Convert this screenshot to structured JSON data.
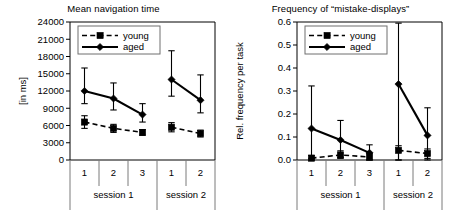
{
  "figure": {
    "panels": [
      "left",
      "right"
    ]
  },
  "chart_data": [
    {
      "panel": "left",
      "type": "line",
      "title": "Mean navigation time",
      "xlabel": "",
      "ylabel": "[in ms]",
      "ylim": [
        0,
        24000
      ],
      "yticks": [
        0,
        3000,
        6000,
        9000,
        12000,
        15000,
        18000,
        21000,
        24000
      ],
      "ytick_labels": [
        "0",
        "3000",
        "6000",
        "9000",
        "12000",
        "15000",
        "18000",
        "21000",
        "24000"
      ],
      "grid": false,
      "legend_position": "top-left",
      "categories": [
        "1",
        "2",
        "3",
        "1",
        "2"
      ],
      "groups": [
        {
          "label": "session 1",
          "categories": [
            "1",
            "2",
            "3"
          ]
        },
        {
          "label": "session 2",
          "categories": [
            "1",
            "2"
          ]
        }
      ],
      "series": [
        {
          "name": "young",
          "marker": "square",
          "line": "dashed",
          "values": [
            6600,
            5500,
            4800,
            5700,
            4600
          ],
          "err_low": [
            1100,
            700,
            500,
            800,
            600
          ],
          "err_high": [
            1100,
            700,
            500,
            800,
            600
          ]
        },
        {
          "name": "aged",
          "marker": "diamond",
          "line": "solid",
          "values": [
            12000,
            10700,
            7900,
            14000,
            10400
          ],
          "err_low": [
            2200,
            2000,
            1300,
            2900,
            2200
          ],
          "err_high": [
            4000,
            2700,
            1900,
            5000,
            4400
          ]
        }
      ]
    },
    {
      "panel": "right",
      "type": "line",
      "title": "Frequency of “mistake-displays”",
      "xlabel": "",
      "ylabel": "Rel. frequency per task",
      "ylim": [
        0.0,
        0.6
      ],
      "yticks": [
        0.0,
        0.1,
        0.2,
        0.3,
        0.4,
        0.5,
        0.6
      ],
      "ytick_labels": [
        "0.0",
        "0.1",
        "0.2",
        "0.3",
        "0.4",
        "0.5",
        "0.6"
      ],
      "grid": false,
      "legend_position": "top-left",
      "categories": [
        "1",
        "2",
        "3",
        "1",
        "2"
      ],
      "groups": [
        {
          "label": "session 1",
          "categories": [
            "1",
            "2",
            "3"
          ]
        },
        {
          "label": "session 2",
          "categories": [
            "1",
            "2"
          ]
        }
      ],
      "series": [
        {
          "name": "young",
          "marker": "square",
          "line": "dashed",
          "values": [
            0.008,
            0.022,
            0.013,
            0.042,
            0.028
          ],
          "err_low": [
            0.008,
            0.012,
            0.013,
            0.042,
            0.028
          ],
          "err_high": [
            0.012,
            0.018,
            0.016,
            0.02,
            0.02
          ]
        },
        {
          "name": "aged",
          "marker": "diamond",
          "line": "solid",
          "values": [
            0.137,
            0.087,
            0.031,
            0.33,
            0.107
          ],
          "err_low": [
            0.13,
            0.08,
            0.031,
            0.33,
            0.1
          ],
          "err_high": [
            0.185,
            0.085,
            0.035,
            0.265,
            0.12
          ]
        }
      ]
    }
  ],
  "legend": {
    "young": "young",
    "aged": "aged"
  },
  "colors": {
    "ink": "#000000",
    "axis": "#000000",
    "separator": "#7a7a7a",
    "background": "#ffffff"
  }
}
